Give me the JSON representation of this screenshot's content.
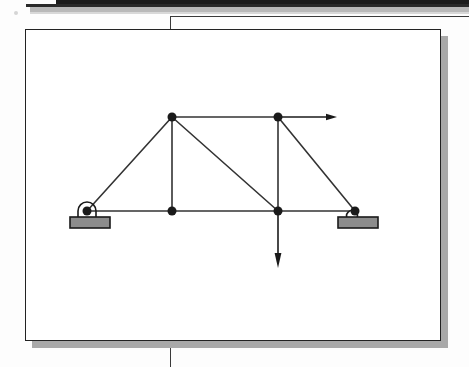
{
  "page": {
    "kind": "scanned-textbook-figure",
    "background_color": "#fdfdfd",
    "scan_artifact_color": "#1c1c1c",
    "scan_shadow_color": "#b9b9b9"
  },
  "figure_card": {
    "border_color": "#222222",
    "fill_color": "#ffffff",
    "shadow_color": "#a9a9a9",
    "x": 25,
    "y": 29,
    "width": 416,
    "height": 312
  },
  "frame": {
    "rule_color": "#3a3a3a",
    "vertical_rule_x": 170,
    "horizontal_rule_y": 16
  },
  "diagram": {
    "type": "truss-free-body-diagram",
    "member_color": "#333333",
    "node_color": "#1a1a1a",
    "support_plate_fill": "#8c8c8c",
    "support_plate_stroke": "#1a1a1a",
    "arrow_color": "#1a1a1a",
    "node_radius": 4.5,
    "member_width": 1.6,
    "nodes": [
      {
        "id": "A",
        "name": "left-support-node",
        "x": 87,
        "y": 211
      },
      {
        "id": "B",
        "name": "top-left-node",
        "x": 172,
        "y": 117
      },
      {
        "id": "C",
        "name": "bottom-mid-node",
        "x": 172,
        "y": 211
      },
      {
        "id": "D",
        "name": "top-right-node",
        "x": 278,
        "y": 117
      },
      {
        "id": "E",
        "name": "bottom-load-node",
        "x": 278,
        "y": 211
      },
      {
        "id": "F",
        "name": "right-support-node",
        "x": 355,
        "y": 211
      }
    ],
    "members": [
      {
        "name": "member-A-B",
        "from": "A",
        "to": "B"
      },
      {
        "name": "member-B-D",
        "from": "B",
        "to": "D"
      },
      {
        "name": "member-B-C",
        "from": "B",
        "to": "C"
      },
      {
        "name": "member-B-E",
        "from": "B",
        "to": "E"
      },
      {
        "name": "member-D-E",
        "from": "D",
        "to": "E"
      },
      {
        "name": "member-D-F",
        "from": "D",
        "to": "F"
      },
      {
        "name": "member-A-C",
        "from": "A",
        "to": "C"
      },
      {
        "name": "member-C-E",
        "from": "C",
        "to": "E"
      },
      {
        "name": "member-E-F",
        "from": "E",
        "to": "F"
      }
    ],
    "supports": [
      {
        "name": "pin-support-left",
        "type": "pin",
        "node": "A",
        "plate": {
          "x": 70,
          "y": 217,
          "width": 40,
          "height": 11
        },
        "arch": {
          "cx": 87,
          "cy": 211,
          "r": 9
        }
      },
      {
        "name": "roller-support-right",
        "type": "roller",
        "node": "F",
        "plate": {
          "x": 338,
          "y": 217,
          "width": 40,
          "height": 11
        },
        "roller": {
          "cx": 352,
          "cy": 216,
          "r": 5.5
        }
      }
    ],
    "loads": [
      {
        "name": "horizontal-load-arrow",
        "direction": "right",
        "at_node": "D",
        "from": {
          "x": 279,
          "y": 117
        },
        "to": {
          "x": 337,
          "y": 117
        }
      },
      {
        "name": "vertical-load-arrow",
        "direction": "down",
        "at_node": "E",
        "from": {
          "x": 278,
          "y": 213
        },
        "to": {
          "x": 278,
          "y": 268
        }
      }
    ]
  }
}
